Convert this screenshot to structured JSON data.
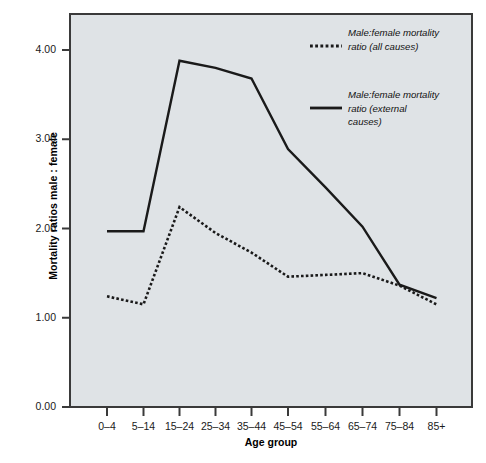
{
  "chart_data": {
    "type": "line",
    "title": "",
    "xlabel": "Age group",
    "ylabel": "Mortality ratios male : female",
    "categories": [
      "0–4",
      "5–14",
      "15–24",
      "25–34",
      "35–44",
      "45–54",
      "55–64",
      "65–74",
      "75–84",
      "85+"
    ],
    "ylim": [
      0.0,
      4.6
    ],
    "yticks": [
      0.0,
      1.0,
      2.0,
      3.0,
      4.0
    ],
    "ytick_labels": [
      "0.00",
      "1.00",
      "2.00",
      "3.00",
      "4.00"
    ],
    "grid": false,
    "legend_position": "top-right inside plot",
    "series": [
      {
        "name": "Male:female mortality ratio (all causes)",
        "style": "dotted",
        "color": "#1a1a1a",
        "values": [
          1.24,
          1.15,
          2.24,
          1.95,
          1.73,
          1.46,
          1.48,
          1.5,
          1.36,
          1.15
        ]
      },
      {
        "name": "Male:female mortality ratio (external causes)",
        "style": "solid",
        "color": "#1a1a1a",
        "values": [
          1.97,
          1.97,
          3.88,
          3.8,
          3.68,
          2.89,
          2.46,
          2.02,
          1.37,
          1.22
        ]
      }
    ]
  },
  "legend": {
    "entries": [
      {
        "label": "Male:female mortality ratio (all causes)",
        "style": "dotted"
      },
      {
        "label": "Male:female mortality ratio (external causes)",
        "style": "solid"
      }
    ]
  },
  "colors": {
    "plot_background": "#dfe3e6",
    "frame": "#3a3a3a",
    "line": "#1a1a1a",
    "text": "#111111"
  }
}
